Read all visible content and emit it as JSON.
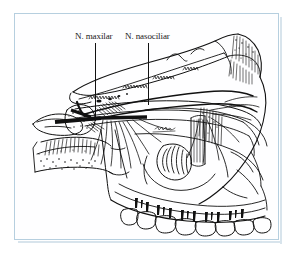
{
  "figure": {
    "domain_kind": "anatomical-line-drawing",
    "frame": {
      "border_color": "#b6cfdf",
      "background_color": "#fefeff",
      "shadow_color": "#d8e4ec"
    },
    "ink_color": "#111111",
    "labels": [
      {
        "id": "maxilar",
        "text": "N. maxilar",
        "leader": "vertical-line-down"
      },
      {
        "id": "nasociliar",
        "text": "N. nasociliar",
        "leader": "vertical-line-down"
      }
    ],
    "structures": [
      "orbital roof",
      "sphenoid body",
      "pterygopalatine fossa",
      "nasal cavity / ethmoid region",
      "hard palate",
      "maxillary tuberosity",
      "upper dental arch",
      "nerve trunks and branches"
    ],
    "tooth_count": 8
  }
}
